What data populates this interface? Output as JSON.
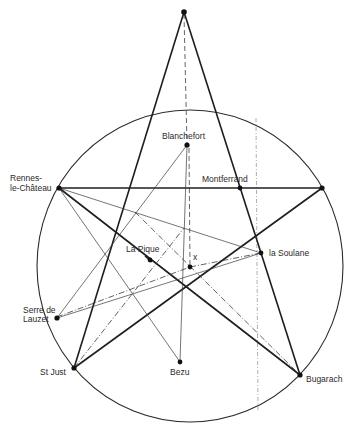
{
  "diagram": {
    "labels": {
      "blanchefort": "Blanchefort",
      "rennes_1": "Rennes-",
      "rennes_2": "le-Château",
      "montferrand": "Montferrand",
      "la_pique": "La Pique",
      "x_mark": "x",
      "la_soulane": "la Soulane",
      "serre_1": "Serre de",
      "serre_2": "Lauzet",
      "st_just": "St Just",
      "bezu": "Bezu",
      "bugarach": "Bugarach"
    },
    "sites": [
      "Apex",
      "Blanchefort",
      "Rennes-le-Château",
      "Montferrand",
      "Right point",
      "La Pique",
      "x",
      "la Soulane",
      "Serre de Lauzet",
      "St Just",
      "Bezu",
      "Bugarach"
    ],
    "colors": {
      "ink": "#1e1e1e",
      "faint": "#999999",
      "background": "#ffffff"
    }
  }
}
